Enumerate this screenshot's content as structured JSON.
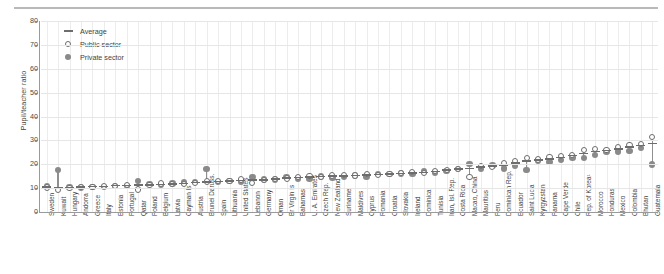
{
  "figure": {
    "top_rule": true,
    "background": "#ffffff",
    "accent_gray": "#8a8a8a",
    "outline_gray": "#6d6d6d"
  },
  "legend": {
    "position": "top-left-inside",
    "items": [
      {
        "label": "Average",
        "marker": "line-marker-icon"
      },
      {
        "label": "Public sector",
        "marker": "open-circle-icon"
      },
      {
        "label": "Private sector",
        "marker": "filled-circle-icon"
      }
    ]
  },
  "chart_data": {
    "type": "scatter",
    "title": "",
    "subtitle": "",
    "xlabel": "",
    "ylabel": "Pupil/teacher ratio",
    "ylim": [
      0,
      80
    ],
    "yticks": [
      0,
      10,
      20,
      30,
      40,
      50,
      60,
      70,
      80
    ],
    "grid": true,
    "legend_position": "upper left",
    "categories": [
      "Sweden",
      "Kuwait",
      "Hungary",
      "Andorra",
      "Greece",
      "Italy",
      "Estonia",
      "Portugal",
      "Qatar",
      "Poland",
      "Belgium",
      "Latvia",
      "Cayman Is",
      "Austria",
      "Brunei Daruss.",
      "Spain",
      "Lithuania",
      "United States",
      "Lebanon",
      "Germany",
      "Oman",
      "Br Virgin Is",
      "Bahamas",
      "U. A. Emirates",
      "Czech Rep.",
      "New Zealand",
      "Suriname",
      "Maldives",
      "Cyprus",
      "Romania",
      "Croatia",
      "Slovakia",
      "Ireland",
      "Dominica",
      "Tunisia",
      "Iran, Isl. Rep.",
      "Costa Rica",
      "Macao, China",
      "Mauritius",
      "Peru",
      "Dominican Rep.",
      "Ecuador",
      "Saint Lucia",
      "Kyrgyzstan",
      "Panama",
      "Cape Verde",
      "Chile",
      "Rep. of Korea¹",
      "Morocco",
      "Honduras",
      "Mexico",
      "Colombia",
      "Bhutan",
      "Guatemala"
    ],
    "series": [
      {
        "name": "Average",
        "marker": "line",
        "values": [
          10.5,
          10.0,
          10.3,
          10.5,
          10.6,
          10.7,
          11.0,
          11.2,
          11.3,
          11.4,
          11.6,
          11.8,
          11.9,
          12.3,
          12.6,
          12.8,
          12.9,
          13.2,
          13.4,
          13.5,
          13.8,
          14.2,
          14.4,
          14.6,
          14.8,
          15.0,
          15.1,
          15.3,
          15.5,
          15.7,
          15.9,
          16.2,
          16.4,
          16.6,
          17.0,
          17.5,
          18.0,
          18.3,
          18.8,
          19.2,
          19.6,
          20.6,
          21.4,
          21.8,
          22.3,
          22.8,
          23.6,
          24.4,
          25.3,
          25.8,
          26.3,
          27.2,
          27.8,
          28.6
        ]
      },
      {
        "name": "Public sector",
        "marker": "open-circle",
        "values": [
          10.3,
          9.1,
          10.2,
          10.6,
          10.6,
          10.8,
          11.0,
          11.4,
          9.4,
          11.2,
          11.9,
          11.7,
          11.6,
          12.2,
          12.8,
          13.0,
          12.9,
          13.6,
          12.1,
          13.4,
          13.9,
          14.0,
          14.6,
          15.0,
          14.8,
          15.3,
          15.5,
          15.3,
          16.0,
          15.6,
          16.0,
          16.2,
          16.7,
          16.4,
          17.3,
          17.6,
          18.0,
          14.7,
          19.4,
          19.0,
          20.6,
          21.5,
          22.6,
          22.0,
          23.1,
          23.4,
          24.0,
          25.8,
          26.4,
          26.0,
          27.1,
          28.0,
          28.4,
          31.4
        ]
      },
      {
        "name": "Private sector",
        "marker": "filled-circle",
        "values": [
          10.8,
          17.6,
          10.5,
          10.2,
          10.6,
          10.4,
          11.0,
          10.8,
          13.0,
          11.8,
          11.2,
          11.9,
          12.4,
          12.5,
          18.0,
          12.5,
          12.9,
          12.5,
          14.6,
          13.6,
          13.6,
          14.6,
          14.0,
          14.0,
          14.8,
          14.5,
          14.6,
          15.3,
          14.8,
          15.9,
          15.8,
          16.2,
          16.0,
          16.9,
          16.5,
          17.3,
          18.1,
          20.1,
          18.0,
          19.5,
          18.3,
          19.4,
          17.5,
          21.5,
          20.9,
          21.8,
          22.9,
          22.6,
          23.8,
          25.4,
          25.3,
          25.6,
          26.9,
          19.9
        ]
      }
    ],
    "footnote": "1. Rep. of Korea"
  }
}
